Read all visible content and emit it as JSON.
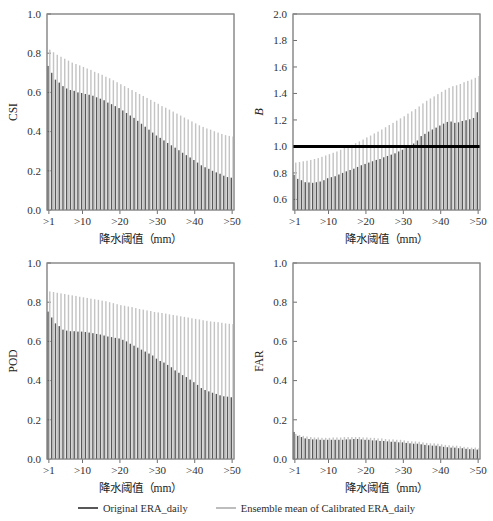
{
  "figure": {
    "background": "#ffffff",
    "width": 493,
    "height": 521
  },
  "legend": {
    "position": "bottom-center",
    "entries": [
      {
        "label": "Original ERA_daily",
        "color": "#585858"
      },
      {
        "label": "Ensemble mean of Calibrated ERA_daily",
        "color": "#bdbdbd"
      }
    ]
  },
  "axis": {
    "xlabel": "降水阈值（mm）",
    "xticks": [
      ">1",
      ">10",
      ">20",
      ">30",
      ">40",
      ">50"
    ],
    "xtick_values": [
      1,
      10,
      20,
      30,
      40,
      50
    ]
  },
  "chart_data": [
    {
      "id": "csi",
      "type": "bar",
      "title": "",
      "xlabel": "降水阈值（mm）",
      "ylabel": "CSI",
      "ylim": [
        0.0,
        1.0
      ],
      "yticks": [
        0.0,
        0.2,
        0.4,
        0.6,
        0.8,
        1.0
      ],
      "ytick_labels": [
        "0.0",
        "0.2",
        "0.4",
        "0.6",
        "0.8",
        "1.0"
      ],
      "grid": false,
      "legend_position": "figure-bottom",
      "categories": [
        ">1",
        ">2",
        ">3",
        ">4",
        ">5",
        ">6",
        ">7",
        ">8",
        ">9",
        ">10",
        ">11",
        ">12",
        ">13",
        ">14",
        ">15",
        ">16",
        ">17",
        ">18",
        ">19",
        ">20",
        ">21",
        ">22",
        ">23",
        ">24",
        ">25",
        ">26",
        ">27",
        ">28",
        ">29",
        ">30",
        ">31",
        ">32",
        ">33",
        ">34",
        ">35",
        ">36",
        ">37",
        ">38",
        ">39",
        ">40",
        ">41",
        ">42",
        ">43",
        ">44",
        ">45",
        ">46",
        ">47",
        ">48",
        ">49",
        ">50"
      ],
      "series": [
        {
          "name": "Original ERA_daily",
          "color": "#585858",
          "values": [
            0.735,
            0.7,
            0.665,
            0.65,
            0.632,
            0.62,
            0.612,
            0.608,
            0.6,
            0.597,
            0.592,
            0.588,
            0.583,
            0.575,
            0.568,
            0.56,
            0.548,
            0.54,
            0.53,
            0.52,
            0.508,
            0.495,
            0.482,
            0.47,
            0.455,
            0.44,
            0.425,
            0.41,
            0.395,
            0.38,
            0.368,
            0.355,
            0.342,
            0.33,
            0.318,
            0.305,
            0.292,
            0.28,
            0.268,
            0.255,
            0.242,
            0.228,
            0.218,
            0.21,
            0.2,
            0.192,
            0.185,
            0.175,
            0.168,
            0.165
          ]
        },
        {
          "name": "Ensemble mean of Calibrated ERA_daily",
          "color": "#c4c4c4",
          "values": [
            0.818,
            0.805,
            0.792,
            0.782,
            0.772,
            0.762,
            0.752,
            0.745,
            0.738,
            0.73,
            0.722,
            0.715,
            0.705,
            0.698,
            0.69,
            0.68,
            0.672,
            0.662,
            0.652,
            0.642,
            0.632,
            0.622,
            0.612,
            0.602,
            0.592,
            0.582,
            0.572,
            0.562,
            0.552,
            0.542,
            0.53,
            0.522,
            0.512,
            0.502,
            0.492,
            0.482,
            0.472,
            0.462,
            0.452,
            0.442,
            0.432,
            0.424,
            0.416,
            0.41,
            0.402,
            0.395,
            0.388,
            0.382,
            0.378,
            0.375
          ]
        }
      ]
    },
    {
      "id": "b",
      "type": "bar",
      "title": "",
      "xlabel": "降水阈值（mm）",
      "ylabel": "B",
      "ylabel_italic": true,
      "ylim": [
        0.52,
        2.0
      ],
      "yticks": [
        0.6,
        0.8,
        1.0,
        1.2,
        1.4,
        1.6,
        1.8,
        2.0
      ],
      "ytick_labels": [
        "0.6",
        "0.8",
        "1.0",
        "1.2",
        "1.4",
        "1.6",
        "1.8",
        "2.0"
      ],
      "grid": false,
      "reference_line": {
        "y": 1.0,
        "color": "#000000",
        "width": 3
      },
      "legend_position": "figure-bottom",
      "categories": [
        ">1",
        ">2",
        ">3",
        ">4",
        ">5",
        ">6",
        ">7",
        ">8",
        ">9",
        ">10",
        ">11",
        ">12",
        ">13",
        ">14",
        ">15",
        ">16",
        ">17",
        ">18",
        ">19",
        ">20",
        ">21",
        ">22",
        ">23",
        ">24",
        ">25",
        ">26",
        ">27",
        ">28",
        ">29",
        ">30",
        ">31",
        ">32",
        ">33",
        ">34",
        ">35",
        ">36",
        ">37",
        ">38",
        ">39",
        ">40",
        ">41",
        ">42",
        ">43",
        ">44",
        ">45",
        ">46",
        ">47",
        ">48",
        ">49",
        ">50"
      ],
      "series": [
        {
          "name": "Original ERA_daily",
          "color": "#585858",
          "values": [
            0.785,
            0.755,
            0.745,
            0.73,
            0.728,
            0.725,
            0.73,
            0.735,
            0.745,
            0.76,
            0.768,
            0.775,
            0.788,
            0.8,
            0.812,
            0.822,
            0.832,
            0.845,
            0.858,
            0.868,
            0.878,
            0.888,
            0.898,
            0.905,
            0.918,
            0.928,
            0.938,
            0.948,
            0.962,
            0.975,
            0.988,
            1.005,
            1.022,
            1.045,
            1.078,
            1.095,
            1.112,
            1.128,
            1.142,
            1.158,
            1.172,
            1.185,
            1.188,
            1.178,
            1.182,
            1.192,
            1.198,
            1.205,
            1.215,
            1.258
          ]
        },
        {
          "name": "Ensemble mean of Calibrated ERA_daily",
          "color": "#c4c4c4",
          "values": [
            0.878,
            0.882,
            0.888,
            0.892,
            0.898,
            0.905,
            0.912,
            0.922,
            0.932,
            0.942,
            0.952,
            0.962,
            0.975,
            0.988,
            1.0,
            1.012,
            1.025,
            1.038,
            1.052,
            1.068,
            1.082,
            1.098,
            1.112,
            1.128,
            1.145,
            1.162,
            1.178,
            1.195,
            1.212,
            1.228,
            1.248,
            1.265,
            1.282,
            1.302,
            1.325,
            1.345,
            1.362,
            1.378,
            1.395,
            1.412,
            1.428,
            1.442,
            1.455,
            1.462,
            1.472,
            1.485,
            1.495,
            1.505,
            1.518,
            1.532
          ]
        }
      ]
    },
    {
      "id": "pod",
      "type": "bar",
      "title": "",
      "xlabel": "降水阈值（mm）",
      "ylabel": "POD",
      "ylim": [
        0.0,
        1.0
      ],
      "yticks": [
        0.0,
        0.2,
        0.4,
        0.6,
        0.8,
        1.0
      ],
      "ytick_labels": [
        "0.0",
        "0.2",
        "0.4",
        "0.6",
        "0.8",
        "1.0"
      ],
      "grid": false,
      "legend_position": "figure-bottom",
      "categories": [
        ">1",
        ">2",
        ">3",
        ">4",
        ">5",
        ">6",
        ">7",
        ">8",
        ">9",
        ">10",
        ">11",
        ">12",
        ">13",
        ">14",
        ">15",
        ">16",
        ">17",
        ">18",
        ">19",
        ">20",
        ">21",
        ">22",
        ">23",
        ">24",
        ">25",
        ">26",
        ">27",
        ">28",
        ">29",
        ">30",
        ">31",
        ">32",
        ">33",
        ">34",
        ">35",
        ">36",
        ">37",
        ">38",
        ">39",
        ">40",
        ">41",
        ">42",
        ">43",
        ">44",
        ">45",
        ">46",
        ">47",
        ">48",
        ">49",
        ">50"
      ],
      "series": [
        {
          "name": "Original ERA_daily",
          "color": "#585858",
          "values": [
            0.752,
            0.722,
            0.692,
            0.678,
            0.66,
            0.655,
            0.652,
            0.652,
            0.65,
            0.65,
            0.648,
            0.645,
            0.642,
            0.638,
            0.635,
            0.63,
            0.625,
            0.622,
            0.618,
            0.615,
            0.608,
            0.6,
            0.588,
            0.578,
            0.568,
            0.558,
            0.548,
            0.538,
            0.528,
            0.512,
            0.5,
            0.492,
            0.48,
            0.468,
            0.452,
            0.44,
            0.428,
            0.418,
            0.405,
            0.392,
            0.378,
            0.362,
            0.352,
            0.345,
            0.338,
            0.332,
            0.325,
            0.32,
            0.318,
            0.315
          ]
        },
        {
          "name": "Ensemble mean of Calibrated ERA_daily",
          "color": "#c4c4c4",
          "values": [
            0.855,
            0.852,
            0.848,
            0.845,
            0.842,
            0.838,
            0.835,
            0.832,
            0.828,
            0.825,
            0.822,
            0.818,
            0.815,
            0.812,
            0.808,
            0.805,
            0.8,
            0.795,
            0.79,
            0.785,
            0.782,
            0.778,
            0.775,
            0.77,
            0.765,
            0.762,
            0.758,
            0.755,
            0.75,
            0.748,
            0.745,
            0.742,
            0.738,
            0.735,
            0.732,
            0.728,
            0.725,
            0.722,
            0.718,
            0.715,
            0.712,
            0.708,
            0.705,
            0.702,
            0.7,
            0.698,
            0.695,
            0.692,
            0.69,
            0.688
          ]
        }
      ]
    },
    {
      "id": "far",
      "type": "bar",
      "title": "",
      "xlabel": "降水阈值（mm）",
      "ylabel": "FAR",
      "ylim": [
        0.0,
        1.0
      ],
      "yticks": [
        0.0,
        0.2,
        0.4,
        0.6,
        0.8,
        1.0
      ],
      "ytick_labels": [
        "0.0",
        "0.2",
        "0.4",
        "0.6",
        "0.8",
        "1.0"
      ],
      "grid": false,
      "legend_position": "figure-bottom",
      "categories": [
        ">1",
        ">2",
        ">3",
        ">4",
        ">5",
        ">6",
        ">7",
        ">8",
        ">9",
        ">10",
        ">11",
        ">12",
        ">13",
        ">14",
        ">15",
        ">16",
        ">17",
        ">18",
        ">19",
        ">20",
        ">21",
        ">22",
        ">23",
        ">24",
        ">25",
        ">26",
        ">27",
        ">28",
        ">29",
        ">30",
        ">31",
        ">32",
        ">33",
        ">34",
        ">35",
        ">36",
        ">37",
        ">38",
        ">39",
        ">40",
        ">41",
        ">42",
        ">43",
        ">44",
        ">45",
        ">46",
        ">47",
        ">48",
        ">49",
        ">50"
      ],
      "series": [
        {
          "name": "Original ERA_daily",
          "color": "#585858",
          "values": [
            0.138,
            0.118,
            0.112,
            0.105,
            0.102,
            0.1,
            0.1,
            0.098,
            0.098,
            0.098,
            0.098,
            0.098,
            0.098,
            0.098,
            0.1,
            0.1,
            0.102,
            0.102,
            0.1,
            0.098,
            0.098,
            0.095,
            0.095,
            0.092,
            0.092,
            0.09,
            0.088,
            0.088,
            0.085,
            0.085,
            0.082,
            0.08,
            0.078,
            0.078,
            0.075,
            0.072,
            0.07,
            0.068,
            0.068,
            0.065,
            0.062,
            0.06,
            0.058,
            0.058,
            0.055,
            0.055,
            0.052,
            0.05,
            0.05,
            0.048
          ]
        },
        {
          "name": "Ensemble mean of Calibrated ERA_daily",
          "color": "#c4c4c4",
          "values": [
            0.128,
            0.122,
            0.118,
            0.115,
            0.112,
            0.11,
            0.11,
            0.108,
            0.108,
            0.108,
            0.11,
            0.11,
            0.11,
            0.112,
            0.112,
            0.112,
            0.112,
            0.112,
            0.11,
            0.11,
            0.108,
            0.108,
            0.105,
            0.105,
            0.102,
            0.1,
            0.1,
            0.098,
            0.098,
            0.095,
            0.092,
            0.09,
            0.09,
            0.088,
            0.085,
            0.082,
            0.08,
            0.08,
            0.078,
            0.075,
            0.072,
            0.07,
            0.068,
            0.068,
            0.065,
            0.062,
            0.06,
            0.058,
            0.058,
            0.055
          ]
        }
      ]
    }
  ]
}
